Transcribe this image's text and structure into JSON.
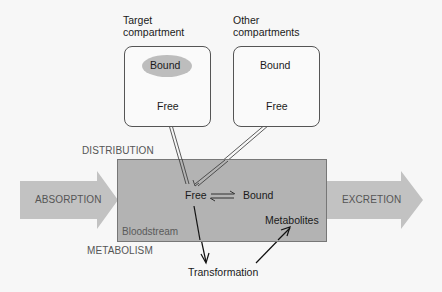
{
  "diagram": {
    "compartments": {
      "target": {
        "header": [
          "Target",
          "compartment"
        ],
        "bound_label": "Bound",
        "free_label": "Free"
      },
      "other": {
        "header": [
          "Other",
          "compartments"
        ],
        "bound_label": "Bound",
        "free_label": "Free"
      }
    },
    "bloodstream": {
      "label": "Bloodstream",
      "free_label": "Free",
      "bound_label": "Bound",
      "metabolites_label": "Metabolites"
    },
    "processes": {
      "absorption": "ABSORPTION",
      "excretion": "EXCRETION",
      "distribution": "DISTRIBUTION",
      "metabolism": "METABOLISM"
    },
    "transformation_label": "Transformation",
    "colors": {
      "background": "#f7f7f7",
      "bloodstream_fill": "#b3b3b3",
      "process_arrow_fill": "#c2c2c2",
      "bound_ellipse_fill": "#bdbdbd",
      "line": "#1a1a1a"
    }
  }
}
